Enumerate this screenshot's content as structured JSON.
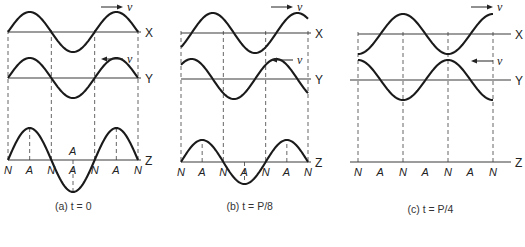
{
  "figure": {
    "panels": [
      {
        "id": "a",
        "caption": "(a) t = 0",
        "x0": 8,
        "x3": 138,
        "phase_deg": 0,
        "amp_x": 20,
        "amp_y": 20,
        "amp_z": 32,
        "y_axis_X": 32,
        "y_axis_Y": 78,
        "y_axis_Z": 160,
        "x_label": "X",
        "y_label": "Y",
        "z_label": "Z",
        "v_label": "v",
        "node_labels": [
          "N",
          "A",
          "N",
          "A",
          "N",
          "A",
          "N"
        ],
        "mid_A_label": "A"
      },
      {
        "id": "b",
        "caption": "(b) t = P/8",
        "x0": 181,
        "x3": 308,
        "phase_deg": 45,
        "amp_x": 20,
        "amp_y": 20,
        "amp_z": 22,
        "y_axis_X": 33,
        "y_axis_Y": 79,
        "y_axis_Z": 162,
        "x_label": "X",
        "y_label": "Y",
        "z_label": "Z",
        "v_label": "v",
        "node_labels": [
          "N",
          "A",
          "N",
          "A",
          "N",
          "A",
          "N"
        ]
      },
      {
        "id": "c",
        "caption": "(c) t = P/4",
        "x0": 358,
        "x3": 493,
        "phase_deg": 90,
        "amp_x": 20,
        "amp_y": 20,
        "amp_z": 0,
        "y_axis_X": 34,
        "y_axis_Y": 80,
        "y_axis_Z": 162,
        "x_label": "X",
        "y_label": "Y",
        "z_label": "Z",
        "v_label": "v",
        "node_labels": [
          "N",
          "A",
          "N",
          "A",
          "N",
          "A",
          "N"
        ]
      }
    ]
  }
}
